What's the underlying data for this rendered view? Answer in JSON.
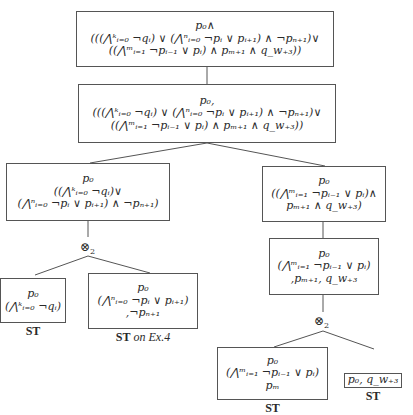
{
  "diagram": {
    "type": "proof-tree",
    "nodes": [
      {
        "id": "n1",
        "lines": [
          "p₀∧",
          "(((⋀ᵏᵢ₌₀ ¬qᵢ) ∨ (⋀ⁿᵢ₌₀ ¬pᵢ ∨ pᵢ₊₁) ∧ ¬pₙ₊₁)∨",
          "((⋀ᵐᵢ₌₁ ¬pᵢ₋₁ ∨ pᵢ) ∧ pₘ₊₁ ∧ q_w₊₃))"
        ]
      },
      {
        "id": "n2",
        "lines": [
          "p₀,",
          "(((⋀ᵏᵢ₌₀ ¬qᵢ) ∨ (⋀ⁿᵢ₌₀ ¬pᵢ ∨ pᵢ₊₁) ∧ ¬pₙ₊₁)∨",
          "((⋀ᵐᵢ₌₁ ¬pᵢ₋₁ ∨ pᵢ) ∧ pₘ₊₁ ∧ q_w₊₃))"
        ]
      },
      {
        "id": "n3",
        "lines": [
          "p₀",
          "((⋀ᵏᵢ₌₀ ¬qᵢ)∨",
          "(⋀ⁿᵢ₌₀ ¬pᵢ ∨ pᵢ₊₁) ∧ ¬pₙ₊₁)"
        ]
      },
      {
        "id": "n4",
        "lines": [
          "p₀",
          "((⋀ᵐᵢ₌₁ ¬pᵢ₋₁ ∨ pᵢ)∧",
          "pₘ₊₁ ∧ q_w₊₃)"
        ]
      },
      {
        "id": "n5",
        "lines": [
          "p₀",
          "(⋀ᵏᵢ₌₀ ¬qᵢ)"
        ],
        "label": "ST"
      },
      {
        "id": "n6",
        "lines": [
          "p₀",
          "(⋀ⁿᵢ₌₀ ¬pᵢ ∨ pᵢ₊₁)",
          ",¬pₙ₊₁"
        ],
        "label": "ST",
        "label_suffix": "on Ex.4"
      },
      {
        "id": "n7",
        "lines": [
          "p₀",
          "(⋀ᵐᵢ₌₁ ¬pᵢ₋₁ ∨ pᵢ)",
          ",pₘ₊₁, q_w₊₃"
        ]
      },
      {
        "id": "n8",
        "lines": [
          "p₀",
          "(⋀ᵐᵢ₌₁ ¬pᵢ₋₁ ∨ pᵢ)",
          "pₘ"
        ],
        "label": "ST"
      },
      {
        "id": "n9",
        "lines": [
          "p₀, q_w₊₃"
        ],
        "label": "ST"
      }
    ],
    "operators": [
      {
        "id": "op-left",
        "symbol": "⊗",
        "subscript": "2"
      },
      {
        "id": "op-right",
        "symbol": "⊗",
        "subscript": "2"
      }
    ],
    "edges": [
      [
        "n1",
        "n2"
      ],
      [
        "n2",
        "n3"
      ],
      [
        "n2",
        "n4"
      ],
      [
        "n3",
        "op-left"
      ],
      [
        "op-left",
        "n5"
      ],
      [
        "op-left",
        "n6"
      ],
      [
        "n4",
        "n7"
      ],
      [
        "n7",
        "op-right"
      ],
      [
        "op-right",
        "n8"
      ],
      [
        "op-right",
        "n9"
      ]
    ]
  }
}
